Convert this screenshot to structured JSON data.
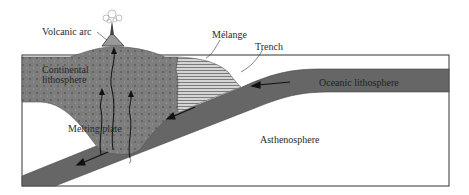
{
  "diagram": {
    "type": "subduction-zone-cross-section",
    "labels": {
      "volcanic_arc": "Volcanic arc",
      "melange": "Mélange",
      "trench": "Trench",
      "continental_lithosphere_line1": "Continental",
      "continental_lithosphere_line2": "lithosphere",
      "oceanic_lithosphere": "Oceanic lithosphere",
      "melting_plate": "Melting plate",
      "asthenosphere": "Asthenosphere"
    },
    "colors": {
      "lithosphere_fill": "#7a7a7a",
      "oceanic_fill": "#666666",
      "melange_fill": "#c8c8c8",
      "frame": "#333333",
      "background": "#ffffff"
    }
  }
}
